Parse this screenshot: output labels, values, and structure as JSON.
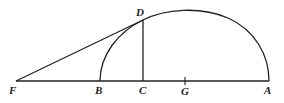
{
  "diagram": {
    "type": "geometric-construction",
    "points": {
      "F": {
        "label": "F",
        "x": 16,
        "y": 81
      },
      "B": {
        "label": "B",
        "x": 100,
        "y": 81
      },
      "C": {
        "label": "C",
        "x": 143,
        "y": 81
      },
      "G": {
        "label": "G",
        "x": 185,
        "y": 81
      },
      "A": {
        "label": "A",
        "x": 269,
        "y": 81
      },
      "D": {
        "label": "D",
        "x": 143,
        "y": 20
      }
    },
    "segments": [
      {
        "from": "F",
        "to": "A",
        "name": "baseline"
      },
      {
        "from": "F",
        "to": "D",
        "name": "tangent-line"
      },
      {
        "from": "C",
        "to": "D",
        "name": "perpendicular"
      }
    ],
    "curves": [
      {
        "name": "ellipse-arc",
        "from": "B",
        "through": "D",
        "to": "A"
      }
    ],
    "stroke_color": "#222222",
    "background": "#ffffff"
  }
}
